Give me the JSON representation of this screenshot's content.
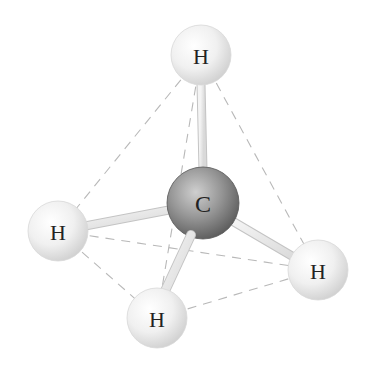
{
  "diagram": {
    "colors": {
      "background": "#ffffff",
      "hydrogen_light": "#ffffff",
      "hydrogen_dark": "#d4d4d4",
      "carbon_light": "#c8c8c8",
      "carbon_dark": "#5a5a5a",
      "bond": "#e6e6e6",
      "bond_outline": "#c4c4c4",
      "edge": "#b8b8b8",
      "label": "#222222"
    },
    "atoms": [
      {
        "id": "C",
        "label": "C",
        "x": 203,
        "y": 203,
        "r": 36,
        "element": "carbon"
      },
      {
        "id": "H1",
        "label": "H",
        "x": 201,
        "y": 55,
        "r": 30,
        "element": "hydrogen",
        "position": "top"
      },
      {
        "id": "H2",
        "label": "H",
        "x": 58,
        "y": 231,
        "r": 30,
        "element": "hydrogen",
        "position": "left"
      },
      {
        "id": "H3",
        "label": "H",
        "x": 157,
        "y": 318,
        "r": 30,
        "element": "hydrogen",
        "position": "bottom"
      },
      {
        "id": "H4",
        "label": "H",
        "x": 318,
        "y": 270,
        "r": 30,
        "element": "hydrogen",
        "position": "right"
      }
    ],
    "bonds": [
      {
        "from": "C",
        "to": "H1"
      },
      {
        "from": "C",
        "to": "H2"
      },
      {
        "from": "C",
        "to": "H3"
      },
      {
        "from": "C",
        "to": "H4"
      }
    ],
    "tetrahedron_edges": [
      {
        "from": "H1",
        "to": "H2"
      },
      {
        "from": "H1",
        "to": "H3"
      },
      {
        "from": "H1",
        "to": "H4"
      },
      {
        "from": "H2",
        "to": "H3"
      },
      {
        "from": "H2",
        "to": "H4"
      },
      {
        "from": "H3",
        "to": "H4"
      }
    ],
    "labels": {
      "carbon": "C",
      "hydrogen_top": "H",
      "hydrogen_left": "H",
      "hydrogen_bottom": "H",
      "hydrogen_right": "H"
    }
  }
}
